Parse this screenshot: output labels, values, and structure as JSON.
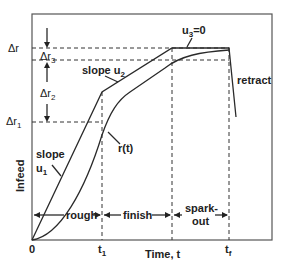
{
  "diagram": {
    "y_axis_label": "Infeed",
    "x_axis_label": "Time, t",
    "x_ticks": [
      "0",
      "t1",
      "tf"
    ],
    "y_levels": [
      {
        "id": "dr",
        "label": "Δr"
      },
      {
        "id": "dr3",
        "label": "Δr3"
      },
      {
        "id": "dr2",
        "label": "Δr2"
      },
      {
        "id": "dr1",
        "label": "Δr1"
      }
    ],
    "annotations": {
      "slope_u1": [
        "slope",
        "u1"
      ],
      "slope_u2": "slope u2",
      "u3": "u3=0",
      "r_t": "r(t)",
      "retract": "retract"
    },
    "phases": [
      "rough",
      "finish",
      "spark-out"
    ],
    "phase_spark_lines": [
      "spark-",
      "out"
    ]
  }
}
